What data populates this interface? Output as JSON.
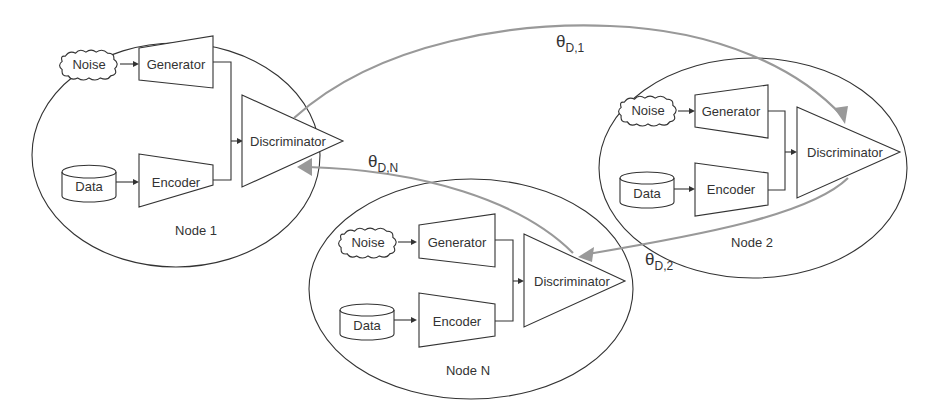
{
  "diagram": {
    "nodes": [
      {
        "id": "node1",
        "label": "Node 1",
        "noise": "Noise",
        "generator": "Generator",
        "data": "Data",
        "encoder": "Encoder",
        "discriminator": "Discriminator"
      },
      {
        "id": "node2",
        "label": "Node 2",
        "noise": "Noise",
        "generator": "Generator",
        "data": "Data",
        "encoder": "Encoder",
        "discriminator": "Discriminator"
      },
      {
        "id": "nodeN",
        "label": "Node N",
        "noise": "Noise",
        "generator": "Generator",
        "data": "Data",
        "encoder": "Encoder",
        "discriminator": "Discriminator"
      }
    ],
    "edges": [
      {
        "from": "Node 1",
        "to": "Node 2",
        "symbol": "θ",
        "subscript": "D,1"
      },
      {
        "from": "Node 2",
        "to": "Node N",
        "symbol": "θ",
        "subscript": "D,2"
      },
      {
        "from": "Node N",
        "to": "Node 1",
        "symbol": "θ",
        "subscript": "D,N"
      }
    ],
    "colors": {
      "outline": "#333333",
      "arc": "#999999",
      "background": "#ffffff"
    }
  }
}
